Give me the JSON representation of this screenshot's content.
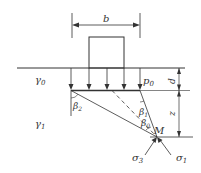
{
  "diagram": {
    "title": "",
    "labels": {
      "width": "b",
      "gamma0": "γ",
      "gamma0_sub": "0",
      "gamma1": "γ",
      "gamma1_sub": "1",
      "p0": "p",
      "p0_sub": "0",
      "depth": "d",
      "z": "z",
      "beta2": "β",
      "beta2_sub": "2",
      "beta1": "β",
      "beta1_sub": "1",
      "beta0": "β",
      "beta0_sub": "0",
      "point": "M",
      "sigma3": "σ",
      "sigma3_sub": "3",
      "sigma1": "σ",
      "sigma1_sub": "1"
    },
    "colors": {
      "line": "#333333",
      "background": "#ffffff"
    }
  }
}
